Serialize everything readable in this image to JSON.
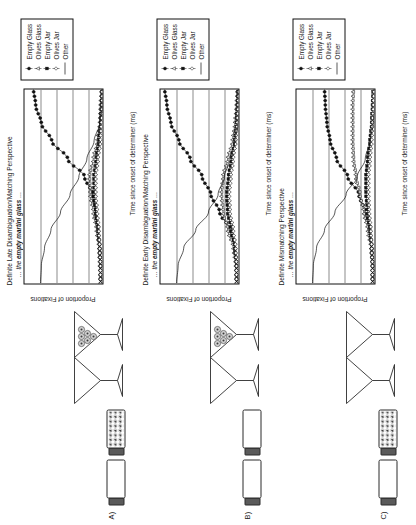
{
  "figure": {
    "panels": [
      {
        "key": "A",
        "label": "A)",
        "title": "Definite Late Disambiguation/Matching Perspective",
        "subtitle_prefix": "… the",
        "subtitle_bold": "empty martini glass",
        "subtitle_suffix": "…",
        "stimuli": [
          {
            "name": "empty-jar",
            "type": "jar",
            "filled": false
          },
          {
            "name": "olives-jar",
            "type": "jar",
            "filled": true
          },
          {
            "name": "empty-glass",
            "type": "glass",
            "filled": false
          },
          {
            "name": "olives-glass",
            "type": "glass",
            "filled": true
          }
        ]
      },
      {
        "key": "B",
        "label": "B)",
        "title": "Definite Early Disambiguation/Matching Perspective",
        "subtitle_prefix": "… the",
        "subtitle_bold": "empty martini glass",
        "subtitle_suffix": "…",
        "stimuli": [
          {
            "name": "empty-jar",
            "type": "jar",
            "filled": false
          },
          {
            "name": "empty-jar-2",
            "type": "jar",
            "filled": false
          },
          {
            "name": "empty-glass",
            "type": "glass",
            "filled": false
          },
          {
            "name": "olives-glass",
            "type": "glass",
            "filled": true
          }
        ]
      },
      {
        "key": "C",
        "label": "C)",
        "title": "Definite Mismatching Perspective",
        "subtitle_prefix": "… the",
        "subtitle_bold": "empty martini glass",
        "subtitle_suffix": "…",
        "stimuli": [
          {
            "name": "empty-jar",
            "type": "jar",
            "filled": false
          },
          {
            "name": "olives-jar",
            "type": "jar",
            "filled": true
          },
          {
            "name": "empty-glass",
            "type": "glass",
            "filled": false
          },
          {
            "name": "empty-glass-2",
            "type": "glass",
            "filled": false
          }
        ]
      }
    ],
    "legend": {
      "entries": [
        {
          "label": "Empty Glass",
          "marker": "filled-circle",
          "error_bars": true
        },
        {
          "label": "Olives Glass",
          "marker": "open-triangle",
          "error_bars": true
        },
        {
          "label": "Empty Jar",
          "marker": "filled-square",
          "error_bars": true
        },
        {
          "label": "Olives Jar",
          "marker": "open-diamond",
          "error_bars": true
        },
        {
          "label": "Other",
          "marker": "line",
          "error_bars": false
        }
      ]
    }
  },
  "chart_data": [
    {
      "panel": "A",
      "type": "line",
      "title": "Definite Late Disambiguation/Matching Perspective",
      "subtitle": "… the empty martini glass …",
      "xlabel": "Time since onset of determiner (ms)",
      "ylabel": "Proportion of Fixations",
      "xlim": [
        -200,
        2000
      ],
      "ylim": [
        0.0,
        1.0
      ],
      "xticks": [
        -200,
        0,
        200,
        400,
        600,
        800,
        1000,
        1200,
        1400,
        1600,
        1800,
        2000
      ],
      "xticklabels": [
        "-200",
        "0",
        "200",
        "400",
        "600",
        "800",
        "1,000",
        "1,200",
        "1,400",
        "1,600",
        "1,800",
        "2,000"
      ],
      "yticks": [
        0.0,
        0.2,
        0.4,
        0.6,
        0.8,
        1.0
      ],
      "yticklabels": [
        "0.00",
        "0.20",
        "0.40",
        "0.60",
        "0.80",
        "1.00"
      ],
      "grid": "horizontal",
      "legend_position": "outside-right",
      "x": [
        -200,
        0,
        200,
        400,
        600,
        800,
        1000,
        1200,
        1400,
        1600,
        1800,
        2000
      ],
      "series": [
        {
          "name": "Empty Glass",
          "marker": "filled-circle",
          "values": [
            0.05,
            0.05,
            0.06,
            0.08,
            0.11,
            0.15,
            0.25,
            0.46,
            0.66,
            0.79,
            0.86,
            0.89
          ]
        },
        {
          "name": "Olives Glass",
          "marker": "open-triangle",
          "values": [
            0.05,
            0.06,
            0.07,
            0.1,
            0.14,
            0.18,
            0.19,
            0.14,
            0.09,
            0.06,
            0.05,
            0.04
          ]
        },
        {
          "name": "Empty Jar",
          "marker": "filled-square",
          "values": [
            0.05,
            0.05,
            0.06,
            0.08,
            0.11,
            0.13,
            0.13,
            0.1,
            0.07,
            0.05,
            0.04,
            0.03
          ]
        },
        {
          "name": "Olives Jar",
          "marker": "open-diamond",
          "values": [
            0.05,
            0.05,
            0.06,
            0.07,
            0.09,
            0.11,
            0.11,
            0.08,
            0.05,
            0.04,
            0.03,
            0.03
          ]
        },
        {
          "name": "Other",
          "marker": "line",
          "values": [
            0.8,
            0.79,
            0.75,
            0.67,
            0.55,
            0.43,
            0.32,
            0.22,
            0.13,
            0.06,
            0.02,
            0.01
          ]
        }
      ]
    },
    {
      "panel": "B",
      "type": "line",
      "title": "Definite Early Disambiguation/Matching Perspective",
      "subtitle": "… the empty martini glass …",
      "xlabel": "Time since onset of determiner (ms)",
      "ylabel": "Proportion of Fixations",
      "xlim": [
        -200,
        2000
      ],
      "ylim": [
        0.0,
        1.0
      ],
      "xticks": [
        -200,
        0,
        200,
        400,
        600,
        800,
        1000,
        1200,
        1400,
        1600,
        1800,
        2000
      ],
      "xticklabels": [
        "-200",
        "0",
        "200",
        "400",
        "600",
        "800",
        "1,000",
        "1,200",
        "1,400",
        "1,600",
        "1,800",
        "2,000"
      ],
      "yticks": [
        0.0,
        0.2,
        0.4,
        0.6,
        0.8,
        1.0
      ],
      "yticklabels": [
        "0.00",
        "0.20",
        "0.40",
        "0.60",
        "0.80",
        "1.00"
      ],
      "grid": "horizontal",
      "legend_position": "outside-right",
      "x": [
        -200,
        0,
        200,
        400,
        600,
        800,
        1000,
        1200,
        1400,
        1600,
        1800,
        2000
      ],
      "series": [
        {
          "name": "Empty Glass",
          "marker": "filled-circle",
          "values": [
            0.05,
            0.05,
            0.07,
            0.13,
            0.26,
            0.37,
            0.48,
            0.63,
            0.77,
            0.87,
            0.92,
            0.95
          ]
        },
        {
          "name": "Olives Glass",
          "marker": "open-triangle",
          "values": [
            0.05,
            0.06,
            0.09,
            0.16,
            0.22,
            0.24,
            0.22,
            0.16,
            0.1,
            0.07,
            0.05,
            0.04
          ]
        },
        {
          "name": "Empty Jar",
          "marker": "filled-square",
          "values": [
            0.05,
            0.05,
            0.07,
            0.11,
            0.16,
            0.17,
            0.15,
            0.11,
            0.07,
            0.05,
            0.04,
            0.03
          ]
        },
        {
          "name": "Olives Jar",
          "marker": "open-diamond",
          "values": [
            0.05,
            0.05,
            0.06,
            0.09,
            0.13,
            0.14,
            0.12,
            0.09,
            0.06,
            0.04,
            0.03,
            0.02
          ]
        },
        {
          "name": "Other",
          "marker": "line",
          "values": [
            0.8,
            0.78,
            0.71,
            0.56,
            0.4,
            0.28,
            0.2,
            0.13,
            0.07,
            0.03,
            0.01,
            0.01
          ]
        }
      ]
    },
    {
      "panel": "C",
      "type": "line",
      "title": "Definite Mismatching Perspective",
      "subtitle": "… the empty martini glass …",
      "xlabel": "Time since onset of determiner (ms)",
      "ylabel": "Proportion of Fixations",
      "xlim": [
        -200,
        2000
      ],
      "ylim": [
        0.0,
        1.0
      ],
      "xticks": [
        -200,
        0,
        200,
        400,
        600,
        800,
        1000,
        1200,
        1400,
        1600,
        1800,
        2000
      ],
      "xticklabels": [
        "-200",
        "0",
        "200",
        "400",
        "600",
        "800",
        "1,000",
        "1,200",
        "1,400",
        "1,600",
        "1,800",
        "2,000"
      ],
      "yticks": [
        0.0,
        0.2,
        0.4,
        0.6,
        0.8,
        1.0
      ],
      "yticklabels": [
        "0.00",
        "0.20",
        "0.40",
        "0.60",
        "0.80",
        "1.00"
      ],
      "grid": "horizontal",
      "legend_position": "outside-right",
      "x": [
        -200,
        0,
        200,
        400,
        600,
        800,
        1000,
        1200,
        1400,
        1600,
        1800,
        2000
      ],
      "series": [
        {
          "name": "Empty Glass",
          "marker": "filled-circle",
          "values": [
            0.05,
            0.05,
            0.06,
            0.09,
            0.14,
            0.22,
            0.36,
            0.5,
            0.58,
            0.62,
            0.64,
            0.65
          ]
        },
        {
          "name": "Olives Glass",
          "marker": "open-triangle",
          "values": [
            0.05,
            0.05,
            0.07,
            0.11,
            0.16,
            0.21,
            0.26,
            0.29,
            0.3,
            0.3,
            0.3,
            0.29
          ]
        },
        {
          "name": "Empty Jar",
          "marker": "filled-square",
          "values": [
            0.05,
            0.05,
            0.06,
            0.08,
            0.11,
            0.13,
            0.13,
            0.11,
            0.08,
            0.06,
            0.05,
            0.04
          ]
        },
        {
          "name": "Olives Jar",
          "marker": "open-diamond",
          "values": [
            0.05,
            0.05,
            0.06,
            0.07,
            0.09,
            0.1,
            0.1,
            0.08,
            0.06,
            0.05,
            0.04,
            0.03
          ]
        },
        {
          "name": "Other",
          "marker": "line",
          "values": [
            0.8,
            0.79,
            0.75,
            0.65,
            0.52,
            0.38,
            0.24,
            0.14,
            0.08,
            0.04,
            0.02,
            0.01
          ]
        }
      ]
    }
  ]
}
